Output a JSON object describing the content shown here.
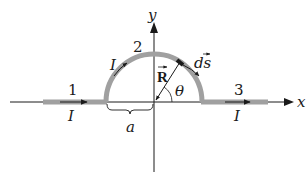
{
  "diagram": {
    "type": "wire-with-semicircle-magnetic-field",
    "axes": {
      "x_label": "x",
      "y_label": "y"
    },
    "segments": [
      {
        "id": "1",
        "label": "1",
        "current_label": "I",
        "shape": "straight",
        "direction": "+x"
      },
      {
        "id": "2",
        "label": "2",
        "current_label": "I",
        "shape": "semicircle",
        "direction": "clockwise"
      },
      {
        "id": "3",
        "label": "3",
        "current_label": "I",
        "shape": "straight",
        "direction": "+x"
      }
    ],
    "vectors": {
      "position_label": "R",
      "element_label": "ds",
      "angle_label": "θ"
    },
    "dimension": {
      "radius_label": "a"
    },
    "colors": {
      "wire": "#a0a0a0",
      "ink": "#1a1a1a",
      "background": "#ffffff"
    }
  }
}
